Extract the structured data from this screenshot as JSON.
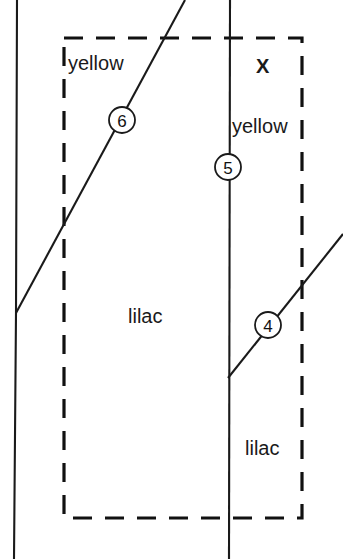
{
  "diagram": {
    "canvas": {
      "width": 343,
      "height": 559,
      "background": "#ffffff"
    },
    "colors": {
      "line": "#1a1a1a",
      "dashed_boundary": "#111111",
      "text": "#1a1a1a",
      "node_fill": "#ffffff"
    },
    "boundary": {
      "name": "study-area-boundary",
      "style": "dashed",
      "x": 64,
      "y": 38,
      "width": 238,
      "height": 480
    },
    "links": [
      {
        "name": "left-vertical-link",
        "style": "solid",
        "points": "17,0 16,313 14,559"
      },
      {
        "name": "center-vertical-link",
        "style": "solid",
        "points": "230,0 229,559"
      },
      {
        "name": "upper-diagonal-link",
        "style": "solid",
        "points": "16,313 185,0"
      },
      {
        "name": "lower-diagonal-link",
        "style": "solid",
        "points": "228,378 343,234"
      }
    ],
    "nodes": [
      {
        "name": "node-marker-6",
        "label": "6",
        "cx": 122,
        "cy": 120,
        "r": 13
      },
      {
        "name": "node-marker-5",
        "label": "5",
        "cx": 228,
        "cy": 167,
        "r": 13
      },
      {
        "name": "node-marker-4",
        "label": "4",
        "cx": 268,
        "cy": 325,
        "r": 13
      }
    ],
    "labels": [
      {
        "name": "region-label-yellow-top-left",
        "text": "yellow",
        "x": 68,
        "y": 62,
        "bold": false
      },
      {
        "name": "region-label-x",
        "text": "X",
        "x": 256,
        "y": 65,
        "bold": true
      },
      {
        "name": "region-label-yellow-right",
        "text": "yellow",
        "x": 232,
        "y": 125,
        "bold": false
      },
      {
        "name": "region-label-lilac-center",
        "text": "lilac",
        "x": 128,
        "y": 315,
        "bold": false
      },
      {
        "name": "region-label-lilac-bottom-right",
        "text": "lilac",
        "x": 245,
        "y": 447,
        "bold": false
      }
    ]
  }
}
